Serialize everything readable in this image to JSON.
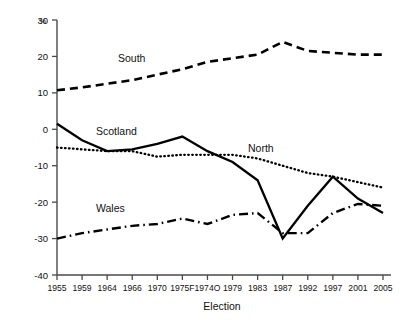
{
  "chart_data": {
    "type": "line",
    "title": "",
    "xlabel": "Election",
    "ylabel": "%",
    "ylim": [
      -40,
      30
    ],
    "yticks": [
      30,
      20,
      10,
      0,
      -10,
      -20,
      -30,
      -40
    ],
    "grid": false,
    "legend_position": "inline-labels",
    "categories": [
      "1955",
      "1959",
      "1964",
      "1966",
      "1970",
      "1975F",
      "1974O",
      "1979",
      "1983",
      "1987",
      "1992",
      "1997",
      "2001",
      "2005"
    ],
    "series": [
      {
        "name": "South",
        "style": "dashed",
        "values": [
          10.7,
          11.5,
          12.5,
          13.5,
          15.0,
          16.5,
          18.5,
          19.5,
          20.5,
          24.0,
          21.5,
          21.0,
          20.5,
          20.5
        ]
      },
      {
        "name": "Scotland",
        "style": "solid",
        "values": [
          1.5,
          -3.0,
          -6.0,
          -5.5,
          -4.0,
          -2.0,
          -6.0,
          -9.0,
          -14.0,
          -30.0,
          -21.0,
          -13.0,
          -19.0,
          -23.0
        ]
      },
      {
        "name": "North",
        "style": "dotted",
        "values": [
          -5.0,
          -5.5,
          -6.0,
          -6.0,
          -7.5,
          -7.0,
          -7.0,
          -7.0,
          -8.0,
          -10.0,
          -12.0,
          -13.0,
          -14.5,
          -16.0
        ]
      },
      {
        "name": "Wales",
        "style": "dashdot",
        "values": [
          -30.0,
          -28.5,
          -27.5,
          -26.5,
          -26.0,
          -24.5,
          -26.0,
          -23.5,
          -23.0,
          -28.5,
          -28.5,
          -23.0,
          -20.5,
          -21.0
        ]
      }
    ],
    "series_label_positions": [
      {
        "name": "South",
        "x": 118,
        "y": 62
      },
      {
        "name": "Scotland",
        "x": 96,
        "y": 135
      },
      {
        "name": "North",
        "x": 248,
        "y": 152
      },
      {
        "name": "Wales",
        "x": 96,
        "y": 212
      }
    ]
  }
}
